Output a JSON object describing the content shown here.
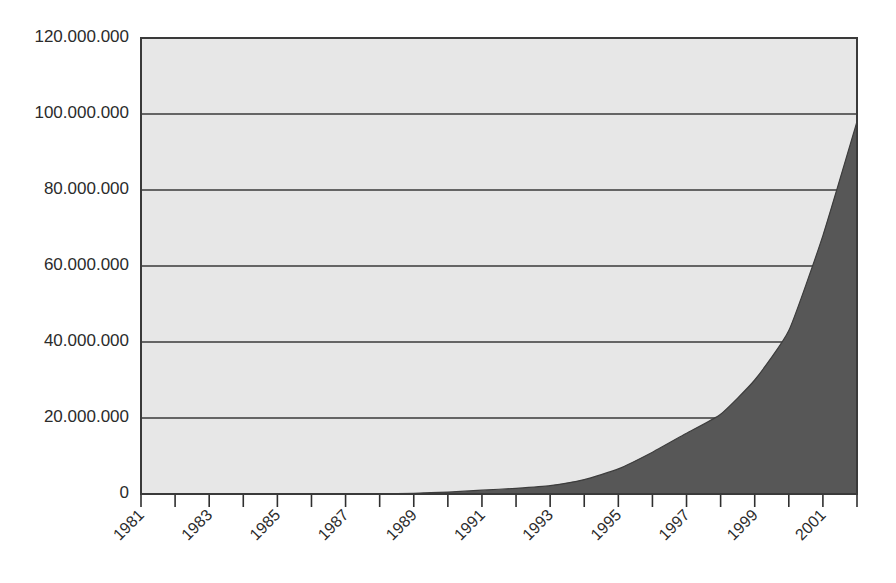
{
  "chart_data": {
    "type": "area",
    "title": "",
    "subtitle": "",
    "xlabel": "",
    "ylabel": "",
    "legend": [],
    "legend_position": "none",
    "grid": true,
    "xlim": [
      1981,
      2002
    ],
    "ylim": [
      0,
      120000000
    ],
    "y_tick_step": 20000000,
    "y_tick_labels": [
      "0",
      "20.000.000",
      "40.000.000",
      "60.000.000",
      "80.000.000",
      "100.000.000",
      "120.000.000"
    ],
    "y_tick_values": [
      0,
      20000000,
      40000000,
      60000000,
      80000000,
      100000000,
      120000000
    ],
    "x_tick_labels": [
      "1981",
      "",
      "1983",
      "",
      "1985",
      "",
      "1987",
      "",
      "1989",
      "",
      "1991",
      "",
      "1993",
      "",
      "1995",
      "",
      "1997",
      "",
      "1999",
      "",
      "2001",
      ""
    ],
    "x_all_ticks": [
      1981,
      1982,
      1983,
      1984,
      1985,
      1986,
      1987,
      1988,
      1989,
      1990,
      1991,
      1992,
      1993,
      1994,
      1995,
      1996,
      1997,
      1998,
      1999,
      2000,
      2001,
      2002
    ],
    "x_labeled_ticks": [
      1981,
      1983,
      1985,
      1987,
      1989,
      1991,
      1993,
      1995,
      1997,
      1999,
      2001
    ],
    "x_label_rotation_deg": -45,
    "categories": [
      "1981",
      "1982",
      "1983",
      "1984",
      "1985",
      "1986",
      "1987",
      "1988",
      "1989",
      "1990",
      "1991",
      "1992",
      "1993",
      "1994",
      "1995",
      "1996",
      "1997",
      "1998",
      "1999",
      "2000",
      "2001",
      "2002"
    ],
    "values": [
      0,
      0,
      0,
      0,
      0,
      0,
      0,
      0,
      200000,
      500000,
      1000000,
      1500000,
      2200000,
      3800000,
      6600000,
      11000000,
      16000000,
      21000000,
      30000000,
      43000000,
      68000000,
      98000000
    ],
    "series": [
      {
        "name": "Hosts",
        "values": [
          0,
          0,
          0,
          0,
          0,
          0,
          0,
          0,
          200000,
          500000,
          1000000,
          1500000,
          2200000,
          3800000,
          6600000,
          11000000,
          16000000,
          21000000,
          30000000,
          43000000,
          68000000,
          98000000
        ]
      }
    ],
    "colors": {
      "area_fill": "#575757",
      "area_stroke": "#3d3d3d",
      "plot_background": "#e7e7e7",
      "gridline": "#3a3a3a",
      "frame": "#3a3a3a",
      "axis_text": "#2b2b2b",
      "page_background": "#ffffff"
    }
  }
}
